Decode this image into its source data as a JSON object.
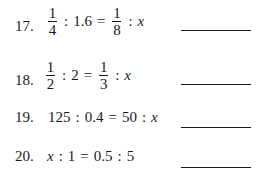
{
  "problems": [
    {
      "number": "17.",
      "a_num": "1",
      "a_den": "4",
      "colon": ":",
      "b": "1.6",
      "eq": "=",
      "c_num": "1",
      "c_den": "8",
      "colon2": ":",
      "d": "x"
    },
    {
      "number": "18.",
      "a_num": "1",
      "a_den": "2",
      "colon": ":",
      "b": "2",
      "eq": "=",
      "c_num": "1",
      "c_den": "3",
      "colon2": ":",
      "d": "x"
    },
    {
      "number": "19.",
      "a": "125",
      "colon": ":",
      "b": "0.4",
      "eq": "=",
      "c": "50",
      "colon2": ":",
      "d": "x"
    },
    {
      "number": "20.",
      "a": "x",
      "colon": ":",
      "b": "1",
      "eq": "=",
      "c": "0.5",
      "colon2": ":",
      "d": "5"
    }
  ]
}
